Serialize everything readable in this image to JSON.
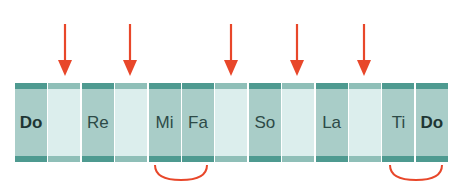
{
  "diagram": {
    "cells": [
      {
        "label": "Do",
        "type": "note",
        "bold": true
      },
      {
        "label": "",
        "type": "gap"
      },
      {
        "label": "Re",
        "type": "note",
        "bold": false
      },
      {
        "label": "",
        "type": "gap"
      },
      {
        "label": "Mi",
        "type": "note",
        "bold": false
      },
      {
        "label": "Fa",
        "type": "note",
        "bold": false
      },
      {
        "label": "",
        "type": "gap"
      },
      {
        "label": "So",
        "type": "note",
        "bold": false
      },
      {
        "label": "",
        "type": "gap"
      },
      {
        "label": "La",
        "type": "note",
        "bold": false
      },
      {
        "label": "",
        "type": "gap"
      },
      {
        "label": "Ti",
        "type": "note",
        "bold": false
      },
      {
        "label": "Do",
        "type": "note",
        "bold": true
      }
    ],
    "arrows_over_cells": [
      1,
      3,
      6,
      8,
      10
    ],
    "half_step_arcs": [
      {
        "from": "Mi",
        "to": "Fa"
      },
      {
        "from": "Ti",
        "to": "Do"
      }
    ],
    "colors": {
      "note_cell": "#a9cdc8",
      "note_band": "#4e9a90",
      "gap_cell": "#dceeed",
      "gap_band": "#8fbfb8",
      "arrow": "#e8472a",
      "arc": "#e8472a",
      "text": "#2d4a47"
    }
  }
}
